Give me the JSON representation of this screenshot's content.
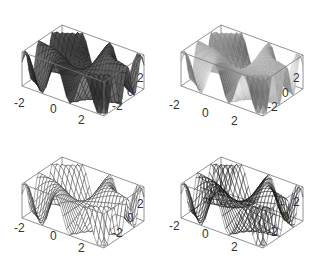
{
  "chart_data": [
    {
      "type": "surface3d",
      "title": "",
      "function": "sin(x*y)",
      "style": "shaded mesh (dark)",
      "x_range": [
        -3,
        3
      ],
      "y_range": [
        -3,
        3
      ],
      "z_range": [
        -1,
        1
      ],
      "x_ticks": [
        "-2",
        "0",
        "2"
      ],
      "y_ticks": [
        "-2",
        "0",
        "2"
      ],
      "boxed": true,
      "fill": "#5a5a5a",
      "mesh": true
    },
    {
      "type": "surface3d",
      "title": "",
      "function": "sin(x*y)",
      "style": "smooth shaded, no mesh",
      "x_range": [
        -3,
        3
      ],
      "y_range": [
        -3,
        3
      ],
      "z_range": [
        -1,
        1
      ],
      "x_ticks": [
        "-2",
        "0",
        "2"
      ],
      "y_ticks": [
        "-2",
        "0",
        "2"
      ],
      "boxed": true,
      "fill": "#a8a8a8",
      "mesh": false
    },
    {
      "type": "surface3d",
      "title": "",
      "function": "sin(x*y)",
      "style": "white fill with mesh",
      "x_range": [
        -3,
        3
      ],
      "y_range": [
        -3,
        3
      ],
      "z_range": [
        -1,
        1
      ],
      "x_ticks": [
        "-2",
        "0",
        "2"
      ],
      "y_ticks": [
        "-2",
        "0",
        "2"
      ],
      "boxed": true,
      "fill": "#ffffff",
      "mesh": true
    },
    {
      "type": "surface3d",
      "title": "",
      "function": "sin(x*y)",
      "style": "transparent wireframe mesh",
      "x_range": [
        -3,
        3
      ],
      "y_range": [
        -3,
        3
      ],
      "z_range": [
        -1,
        1
      ],
      "x_ticks": [
        "-2",
        "0",
        "2"
      ],
      "y_ticks": [
        "-2",
        "0",
        "2"
      ],
      "boxed": true,
      "fill": "none",
      "mesh": true
    }
  ],
  "panels": [
    {
      "ticks": {
        "x": [
          "-2",
          "0",
          "2"
        ],
        "y": [
          "2",
          "0",
          "-2"
        ]
      }
    },
    {
      "ticks": {
        "x": [
          "-2",
          "0",
          "2"
        ],
        "y": [
          "2",
          "0",
          "-2"
        ]
      }
    },
    {
      "ticks": {
        "x": [
          "-2",
          "0",
          "2"
        ],
        "y": [
          "2",
          "0",
          "-2"
        ]
      }
    },
    {
      "ticks": {
        "x": [
          "-2",
          "0",
          "2"
        ],
        "y": [
          "2",
          "0",
          "-2"
        ]
      }
    }
  ]
}
